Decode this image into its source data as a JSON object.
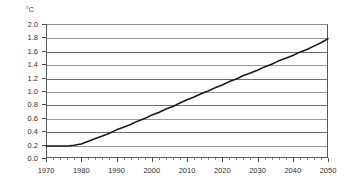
{
  "chart_data": {
    "type": "line",
    "title": "",
    "subtitle": "",
    "xlabel": "",
    "ylabel": "°C",
    "unit_label": "°C",
    "xlim": [
      1970,
      2050
    ],
    "ylim": [
      0.0,
      2.0
    ],
    "grid": "horizontal-only",
    "legend": "none",
    "x_tick_labels": [
      "1970",
      "1980",
      "1990",
      "2000",
      "2010",
      "2020",
      "2030",
      "2040",
      "2050"
    ],
    "x_ticks": [
      1970,
      1980,
      1990,
      2000,
      2010,
      2020,
      2030,
      2040,
      2050
    ],
    "x_minor_tick_interval": 2,
    "y_tick_labels": [
      "0.0",
      "0.2",
      "0.4",
      "0.6",
      "0.8",
      "1.0",
      "1.2",
      "1.4",
      "1.6",
      "1.8",
      "2.0"
    ],
    "y_ticks": [
      0.0,
      0.2,
      0.4,
      0.6,
      0.8,
      1.0,
      1.2,
      1.4,
      1.6,
      1.8,
      2.0
    ],
    "series": [
      {
        "name": "Temperature change",
        "color": "#1a1a1a",
        "x": [
          1970,
          1972,
          1974,
          1976,
          1978,
          1980,
          1982,
          1984,
          1986,
          1988,
          1990,
          1992,
          1994,
          1996,
          1998,
          2000,
          2002,
          2004,
          2006,
          2008,
          2010,
          2012,
          2014,
          2016,
          2018,
          2020,
          2022,
          2024,
          2026,
          2028,
          2030,
          2032,
          2034,
          2036,
          2038,
          2040,
          2042,
          2044,
          2046,
          2048,
          2050
        ],
        "values": [
          0.18,
          0.18,
          0.18,
          0.18,
          0.19,
          0.21,
          0.25,
          0.29,
          0.33,
          0.37,
          0.42,
          0.46,
          0.5,
          0.55,
          0.59,
          0.64,
          0.68,
          0.73,
          0.77,
          0.82,
          0.87,
          0.91,
          0.96,
          1.0,
          1.05,
          1.09,
          1.14,
          1.18,
          1.23,
          1.27,
          1.31,
          1.36,
          1.4,
          1.45,
          1.49,
          1.53,
          1.58,
          1.62,
          1.67,
          1.72,
          1.78
        ]
      }
    ]
  }
}
